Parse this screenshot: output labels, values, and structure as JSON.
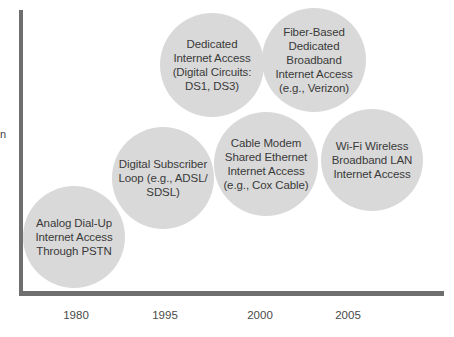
{
  "diagram": {
    "y_axis_label_fragment": "n",
    "x_axis": {
      "ticks": [
        {
          "label": "1980",
          "x": 76
        },
        {
          "label": "1995",
          "x": 165
        },
        {
          "label": "2000",
          "x": 260
        },
        {
          "label": "2005",
          "x": 348
        }
      ]
    },
    "bubbles": [
      {
        "id": "analog-dial-up",
        "text": "Analog Dial-Up\nInternet Access\nThrough PSTN",
        "cx": 74,
        "cy": 237,
        "r": 51
      },
      {
        "id": "dsl",
        "text": "Digital Subscriber\nLoop (e.g., ADSL/\nSDSL)",
        "cx": 163,
        "cy": 178,
        "r": 51
      },
      {
        "id": "dedicated-internet",
        "text": "Dedicated\nInternet Access\n(Digital Circuits:\nDS1, DS3)",
        "cx": 212,
        "cy": 65,
        "r": 52
      },
      {
        "id": "fiber",
        "text": "Fiber-Based\nDedicated\nBroadband\nInternet Access\n(e.g., Verizon)",
        "cx": 314,
        "cy": 60,
        "r": 52
      },
      {
        "id": "cable-modem",
        "text": "Cable Modem\nShared Ethernet\nInternet Access\n(e.g., Cox Cable)",
        "cx": 266,
        "cy": 164,
        "r": 52
      },
      {
        "id": "wifi",
        "text": "Wi-Fi Wireless\nBroadband LAN\nInternet Access",
        "cx": 372,
        "cy": 160,
        "r": 51
      }
    ],
    "colors": {
      "bubble_fill": "#d9d9d9",
      "axis": "#6f6f6f",
      "text": "#3a3a3a"
    }
  }
}
